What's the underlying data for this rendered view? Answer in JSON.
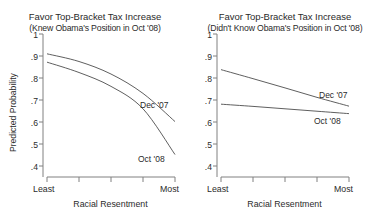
{
  "figure": {
    "background": "#ffffff",
    "line_color": "#4d4d4d",
    "axis_color": "#808080",
    "text_color": "#2b2b2b"
  },
  "panels": [
    {
      "id": "knew",
      "title_main": "Favor Top-Bracket Tax Increase",
      "title_sub": "(Knew Obama's Position in Oct '08)",
      "ylabel": "Predicted Probability",
      "xlabel": "Racial Resentment",
      "y_ticks": [
        "1",
        ".9",
        ".8",
        ".7",
        ".6",
        ".5",
        ".4"
      ],
      "y_tick_values": [
        1,
        0.9,
        0.8,
        0.7,
        0.6,
        0.5,
        0.4
      ],
      "x_tick_labels": [
        "Least",
        "",
        "",
        "",
        "Most"
      ],
      "series_labels": [
        {
          "name": "Dec '07",
          "x": 0.82,
          "y": 0.695
        },
        {
          "name": "Oct '08",
          "x": 0.8,
          "y": 0.435
        }
      ]
    },
    {
      "id": "didnt-know",
      "title_main": "Favor Top-Bracket Tax Increase",
      "title_sub": "(Didn't Know Obama's Position in Oct '08)",
      "ylabel": "",
      "xlabel": "Racial Resentment",
      "y_ticks": [
        "1",
        ".9",
        ".8",
        ".7",
        ".6",
        ".5",
        ".4"
      ],
      "y_tick_values": [
        1,
        0.9,
        0.8,
        0.7,
        0.6,
        0.5,
        0.4
      ],
      "x_tick_labels": [
        "Least",
        "",
        "",
        "",
        "Most"
      ],
      "series_labels": [
        {
          "name": "Dec '07",
          "x": 0.8,
          "y": 0.715
        },
        {
          "name": "Oct '08",
          "x": 0.78,
          "y": 0.618
        }
      ]
    }
  ],
  "chart_data": [
    {
      "type": "line",
      "panel": "Knew Obama's Position in Oct '08",
      "title": "Favor Top-Bracket Tax Increase",
      "subtitle": "(Knew Obama's Position in Oct '08)",
      "xlabel": "Racial Resentment",
      "ylabel": "Predicted Probability",
      "xlim": [
        0,
        1
      ],
      "ylim": [
        0.4,
        1.0
      ],
      "x_tick_labels": [
        "Least",
        "",
        "",
        "",
        "Most"
      ],
      "y_tick_labels": [
        "1",
        ".9",
        ".8",
        ".7",
        ".6",
        ".5",
        ".4"
      ],
      "grid": false,
      "legend": "inline-annotations",
      "x": [
        0,
        0.25,
        0.5,
        0.75,
        1.0
      ],
      "series": [
        {
          "name": "Dec '07",
          "values": [
            0.91,
            0.875,
            0.818,
            0.73,
            0.602
          ]
        },
        {
          "name": "Oct '08",
          "values": [
            0.872,
            0.825,
            0.762,
            0.66,
            0.452
          ]
        }
      ]
    },
    {
      "type": "line",
      "panel": "Didn't Know Obama's Position in Oct '08",
      "title": "Favor Top-Bracket Tax Increase",
      "subtitle": "(Didn't Know Obama's Position in Oct '08)",
      "xlabel": "Racial Resentment",
      "ylabel": "Predicted Probability",
      "xlim": [
        0,
        1
      ],
      "ylim": [
        0.4,
        1.0
      ],
      "x_tick_labels": [
        "Least",
        "",
        "",
        "",
        "Most"
      ],
      "y_tick_labels": [
        "1",
        ".9",
        ".8",
        ".7",
        ".6",
        ".5",
        ".4"
      ],
      "grid": false,
      "legend": "inline-annotations",
      "x": [
        0,
        0.25,
        0.5,
        0.75,
        1.0
      ],
      "series": [
        {
          "name": "Dec '07",
          "values": [
            0.838,
            0.797,
            0.755,
            0.712,
            0.672
          ]
        },
        {
          "name": "Oct '08",
          "values": [
            0.681,
            0.671,
            0.66,
            0.649,
            0.638
          ]
        }
      ]
    }
  ]
}
